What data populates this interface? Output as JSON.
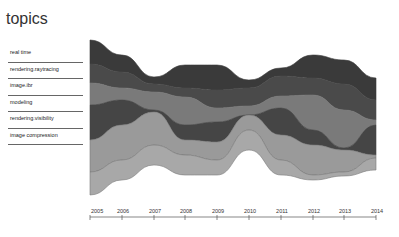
{
  "header": {
    "title": "topics"
  },
  "legend": {
    "items": [
      {
        "label": "real time"
      },
      {
        "label": "rendering.raytracing"
      },
      {
        "label": "image.ibr"
      },
      {
        "label": "modeling"
      },
      {
        "label": "rendering.visibility"
      },
      {
        "label": "image compression"
      }
    ]
  },
  "chart_data": {
    "type": "area",
    "subtype": "streamgraph",
    "title": "topics",
    "xlabel": "",
    "ylabel": "",
    "categories": [
      "2005",
      "2006",
      "2007",
      "2008",
      "2009",
      "2010",
      "2011",
      "2012",
      "2013",
      "2014"
    ],
    "x_pixels": [
      90,
      122,
      154,
      185,
      217,
      249,
      281,
      313,
      344,
      376
    ],
    "series": [
      {
        "name": "real time",
        "color": "#3a3a3a",
        "values": [
          24,
          17,
          7,
          23,
          25,
          8,
          8,
          23,
          24,
          22
        ]
      },
      {
        "name": "rendering.raytracing",
        "color": "#4a4a4a",
        "values": [
          19,
          16,
          8,
          9,
          18,
          18,
          20,
          17,
          26,
          20
        ]
      },
      {
        "name": "image.ibr",
        "color": "#7a7a7a",
        "values": [
          22,
          12,
          18,
          28,
          14,
          9,
          12,
          35,
          38,
          5
        ]
      },
      {
        "name": "modeling",
        "color": "#454545",
        "values": [
          35,
          25,
          2,
          15,
          20,
          0,
          27,
          15,
          2,
          30
        ]
      },
      {
        "name": "rendering.visibility",
        "color": "#9a9a9a",
        "values": [
          32,
          35,
          33,
          15,
          18,
          15,
          25,
          30,
          22,
          3
        ]
      },
      {
        "name": "image compression",
        "color": "#a8a8a8",
        "values": [
          23,
          20,
          20,
          20,
          15,
          20,
          15,
          5,
          4,
          12
        ]
      }
    ],
    "boundaries_y": [
      [
        40,
        64,
        83,
        105,
        140,
        172,
        195
      ],
      [
        55,
        72,
        88,
        100,
        125,
        160,
        180
      ],
      [
        77,
        84,
        92,
        110,
        112,
        145,
        165
      ],
      [
        65,
        88,
        97,
        125,
        140,
        155,
        175
      ],
      [
        65,
        90,
        108,
        122,
        142,
        160,
        175
      ],
      [
        80,
        88,
        106,
        115,
        115,
        130,
        150
      ],
      [
        68,
        76,
        96,
        108,
        135,
        160,
        175
      ],
      [
        55,
        78,
        95,
        130,
        145,
        175,
        180
      ],
      [
        60,
        84,
        110,
        148,
        150,
        172,
        176
      ],
      [
        78,
        100,
        120,
        125,
        155,
        158,
        170
      ]
    ],
    "grid": false,
    "legend_position": "left"
  }
}
